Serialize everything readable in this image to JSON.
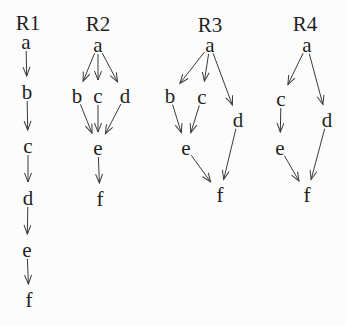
{
  "figure": {
    "type": "directed-graph-diagram",
    "width": 346,
    "height": 326,
    "background": "#fcfcfc",
    "line_color": "#3a3a3a",
    "text_color": "#1f1f1f",
    "graphs": [
      {
        "id": "r1",
        "title": "R1",
        "title_x": 28,
        "title_y": 23,
        "nodes": [
          {
            "id": "a",
            "label": "a",
            "x": 26,
            "y": 42
          },
          {
            "id": "b",
            "label": "b",
            "x": 27,
            "y": 92
          },
          {
            "id": "c",
            "label": "c",
            "x": 28,
            "y": 146
          },
          {
            "id": "d",
            "label": "d",
            "x": 28,
            "y": 198
          },
          {
            "id": "e",
            "label": "e",
            "x": 27,
            "y": 250
          },
          {
            "id": "f",
            "label": "f",
            "x": 29,
            "y": 300
          }
        ],
        "edges": [
          [
            "a",
            "b"
          ],
          [
            "b",
            "c"
          ],
          [
            "c",
            "d"
          ],
          [
            "d",
            "e"
          ],
          [
            "e",
            "f"
          ]
        ]
      },
      {
        "id": "r2",
        "title": "R2",
        "title_x": 98,
        "title_y": 24,
        "nodes": [
          {
            "id": "a",
            "label": "a",
            "x": 98,
            "y": 45
          },
          {
            "id": "b",
            "label": "b",
            "x": 77,
            "y": 96
          },
          {
            "id": "c",
            "label": "c",
            "x": 98,
            "y": 96
          },
          {
            "id": "d",
            "label": "d",
            "x": 125,
            "y": 96
          },
          {
            "id": "e",
            "label": "e",
            "x": 98,
            "y": 148
          },
          {
            "id": "f",
            "label": "f",
            "x": 100,
            "y": 199
          }
        ],
        "edges": [
          [
            "a",
            "b"
          ],
          [
            "a",
            "c"
          ],
          [
            "a",
            "d"
          ],
          [
            "b",
            "e"
          ],
          [
            "c",
            "e"
          ],
          [
            "d",
            "e"
          ],
          [
            "e",
            "f"
          ]
        ]
      },
      {
        "id": "r3",
        "title": "R3",
        "title_x": 210,
        "title_y": 25,
        "nodes": [
          {
            "id": "a",
            "label": "a",
            "x": 210,
            "y": 45
          },
          {
            "id": "b",
            "label": "b",
            "x": 170,
            "y": 96
          },
          {
            "id": "c",
            "label": "c",
            "x": 202,
            "y": 97
          },
          {
            "id": "d",
            "label": "d",
            "x": 238,
            "y": 120
          },
          {
            "id": "e",
            "label": "e",
            "x": 186,
            "y": 148
          },
          {
            "id": "f",
            "label": "f",
            "x": 220,
            "y": 195
          }
        ],
        "edges": [
          [
            "a",
            "b"
          ],
          [
            "a",
            "c"
          ],
          [
            "a",
            "d"
          ],
          [
            "b",
            "e"
          ],
          [
            "c",
            "e"
          ],
          [
            "e",
            "f"
          ],
          [
            "d",
            "f"
          ]
        ]
      },
      {
        "id": "r4",
        "title": "R4",
        "title_x": 305,
        "title_y": 24,
        "nodes": [
          {
            "id": "a",
            "label": "a",
            "x": 307,
            "y": 45
          },
          {
            "id": "c",
            "label": "c",
            "x": 281,
            "y": 99
          },
          {
            "id": "d",
            "label": "d",
            "x": 327,
            "y": 120
          },
          {
            "id": "e",
            "label": "e",
            "x": 280,
            "y": 148
          },
          {
            "id": "f",
            "label": "f",
            "x": 307,
            "y": 195
          }
        ],
        "edges": [
          [
            "a",
            "c"
          ],
          [
            "a",
            "d"
          ],
          [
            "c",
            "e"
          ],
          [
            "e",
            "f"
          ],
          [
            "d",
            "f"
          ]
        ]
      }
    ]
  }
}
